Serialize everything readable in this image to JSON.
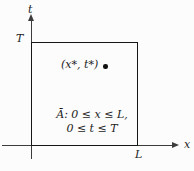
{
  "figure": {
    "axes": {
      "t_axis_label": "t",
      "x_axis_label": "x",
      "t_max_label": "T",
      "x_max_label": "L"
    },
    "point": {
      "label": "(x*, t*)"
    },
    "region": {
      "line1": "Ā: 0 ≤ x ≤ L,",
      "line2": "0 ≤ t ≤ T"
    },
    "colors": {
      "ink": "#161616",
      "axis": "#3c3c3c",
      "background": "#fcfcfc"
    }
  }
}
